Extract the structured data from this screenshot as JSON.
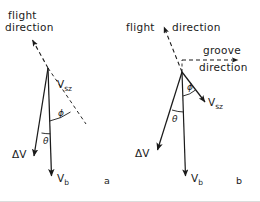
{
  "figure": {
    "width": 260,
    "height": 202,
    "background": "#ffffff",
    "ink": "#1a1a1a"
  },
  "panel_a": {
    "caption": "a",
    "flight_direction_line1": "flight",
    "flight_direction_line2": "direction",
    "vsz_label": "V",
    "vsz_sub": "sz",
    "vb_label": "V",
    "vb_sub": "b",
    "delta_v_label": "ΔV",
    "phi_label": "ϕ",
    "theta_label": "θ",
    "apex": {
      "x": 48,
      "y": 68
    },
    "vb_tip": {
      "x": 52,
      "y": 178
    },
    "dv_tip": {
      "x": 33,
      "y": 158
    },
    "flight_arrow_tip": {
      "x": 31,
      "y": 38
    },
    "vsz_dash_end": {
      "x": 86,
      "y": 124
    }
  },
  "panel_b": {
    "caption": "b",
    "flight_direction_text": "flight",
    "flight_direction_text2": "direction",
    "groove_direction_line1": "groove",
    "groove_direction_line2": "direction",
    "vsz_label": "V",
    "vsz_sub": "sz",
    "vb_label": "V",
    "vb_sub": "b",
    "delta_v_label": "ΔV",
    "phi_label": "ϕ",
    "theta_label": "θ",
    "apex": {
      "x": 182,
      "y": 72
    },
    "vb_tip": {
      "x": 186,
      "y": 178
    },
    "dv_tip": {
      "x": 156,
      "y": 152
    },
    "vsz_tip": {
      "x": 207,
      "y": 104
    },
    "flight_arrow_tip": {
      "x": 163,
      "y": 25
    },
    "groove_arrow_tip": {
      "x": 240,
      "y": 60
    }
  }
}
